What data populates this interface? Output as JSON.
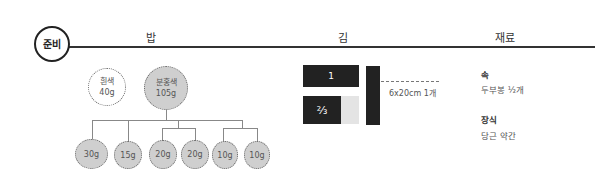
{
  "section": {
    "badge": "준비",
    "columns": {
      "rice": "밥",
      "nori": "김",
      "ingredients": "재료"
    }
  },
  "rice": {
    "top": [
      {
        "name": "흰색",
        "weight": "40g",
        "filled": false
      },
      {
        "name": "분홍색",
        "weight": "105g",
        "filled": true
      }
    ],
    "portions": [
      "30g",
      "15g",
      "20g",
      "20g",
      "10g",
      "10g"
    ]
  },
  "nori": {
    "piece_full": "1",
    "piece_fraction": "⅔",
    "size_label": "6x20cm 1개"
  },
  "ingredients": {
    "filling_title": "속",
    "filling_value": "두부봉 ½개",
    "garnish_title": "장식",
    "garnish_value": "당근 약간"
  },
  "colors": {
    "line": "#333333",
    "fill": "#cfcfcf",
    "nori": "#222222"
  }
}
